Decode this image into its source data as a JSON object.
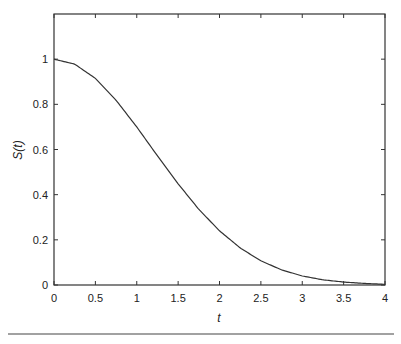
{
  "chart_data": {
    "type": "line",
    "title": "",
    "xlabel": "t",
    "ylabel": "S(t)",
    "xlim": [
      0,
      4
    ],
    "ylim": [
      0,
      1.2
    ],
    "grid": false,
    "legend": null,
    "x_ticks": [
      "0",
      "0.5",
      "1",
      "1.5",
      "2",
      "2.5",
      "3",
      "3.5",
      "4"
    ],
    "y_ticks": [
      "0",
      "0.2",
      "0.4",
      "0.6",
      "0.8",
      "1"
    ],
    "series": [
      {
        "name": "S(t)",
        "x": [
          0,
          0.25,
          0.5,
          0.75,
          1,
          1.25,
          1.5,
          1.75,
          2,
          2.25,
          2.5,
          2.75,
          3,
          3.25,
          3.5,
          3.75,
          4
        ],
        "values": [
          1.0,
          0.978,
          0.915,
          0.818,
          0.7,
          0.572,
          0.448,
          0.335,
          0.24,
          0.164,
          0.107,
          0.067,
          0.04,
          0.023,
          0.013,
          0.007,
          0.003
        ]
      }
    ]
  },
  "footer_rule": true
}
